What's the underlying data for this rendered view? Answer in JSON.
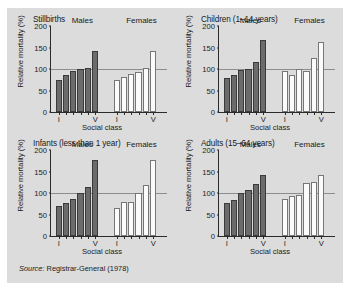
{
  "figure": {
    "source_prefix": "Source:",
    "source_text": "Registrar-General (1978)",
    "background_color": "#dcdcdc",
    "male_color": "#6b6b6b",
    "female_color": "#fbfbfb"
  },
  "chart_data": [
    {
      "type": "bar",
      "title": "Stillbirths",
      "xlabel": "Social class",
      "ylabel": "Relative mortality (%)",
      "ylim": [
        0,
        200
      ],
      "yticks": [
        0,
        50,
        100,
        150,
        200
      ],
      "reference_line": 100,
      "grid": false,
      "legend_position": "inline-group-labels",
      "categories": [
        "I",
        "II",
        "IIIN",
        "IIIM",
        "IV",
        "V"
      ],
      "tick_labels": [
        "I",
        "",
        "",
        "",
        "",
        "V"
      ],
      "series": [
        {
          "name": "Males",
          "values": [
            74,
            85,
            96,
            101,
            103,
            142
          ]
        },
        {
          "name": "Females",
          "values": [
            75,
            81,
            88,
            94,
            103,
            143
          ]
        }
      ]
    },
    {
      "type": "bar",
      "title": "Children (1–14 years)",
      "xlabel": "Social class",
      "ylabel": "Relative mortality (%)",
      "ylim": [
        0,
        200
      ],
      "yticks": [
        0,
        50,
        100,
        150,
        200
      ],
      "reference_line": 100,
      "grid": false,
      "legend_position": "inline-group-labels",
      "categories": [
        "I",
        "II",
        "IIIN",
        "IIIM",
        "IV",
        "V"
      ],
      "tick_labels": [
        "I",
        "",
        "",
        "",
        "",
        "V"
      ],
      "series": [
        {
          "name": "Males",
          "values": [
            80,
            85,
            97,
            100,
            117,
            167
          ]
        },
        {
          "name": "Females",
          "values": [
            96,
            86,
            101,
            96,
            126,
            162
          ]
        }
      ]
    },
    {
      "type": "bar",
      "title": "Infants (less than 1 year)",
      "xlabel": "Social class",
      "ylabel": "Relative mortality (%)",
      "ylim": [
        0,
        200
      ],
      "yticks": [
        0,
        50,
        100,
        150,
        200
      ],
      "reference_line": 100,
      "grid": false,
      "legend_position": "inline-group-labels",
      "categories": [
        "I",
        "II",
        "IIIN",
        "IIIM",
        "IV",
        "V"
      ],
      "tick_labels": [
        "I",
        "",
        "",
        "",
        "",
        "V"
      ],
      "series": [
        {
          "name": "Males",
          "values": [
            69,
            77,
            85,
            100,
            113,
            176
          ]
        },
        {
          "name": "Females",
          "values": [
            66,
            79,
            78,
            101,
            118,
            176
          ]
        }
      ]
    },
    {
      "type": "bar",
      "title": "Adults (15–64 years)",
      "xlabel": "Social class",
      "ylabel": "Relative mortality (%)",
      "ylim": [
        0,
        200
      ],
      "yticks": [
        0,
        50,
        100,
        150,
        200
      ],
      "reference_line": 100,
      "grid": false,
      "legend_position": "inline-group-labels",
      "categories": [
        "I",
        "II",
        "IIIN",
        "IIIM",
        "IV",
        "V"
      ],
      "tick_labels": [
        "I",
        "",
        "",
        "",
        "",
        "V"
      ],
      "series": [
        {
          "name": "Males",
          "values": [
            77,
            83,
            99,
            108,
            120,
            142
          ]
        },
        {
          "name": "Females",
          "values": [
            86,
            92,
            96,
            124,
            126,
            142
          ]
        }
      ]
    }
  ]
}
